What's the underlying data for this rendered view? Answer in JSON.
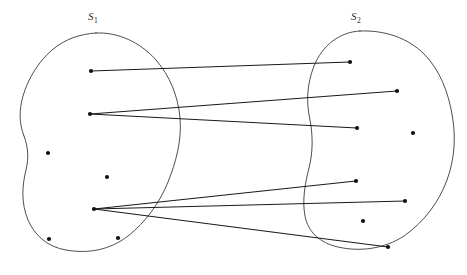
{
  "diagram": {
    "type": "set-mapping-diagram",
    "background_color": "#ffffff",
    "outline_color": "#3a3a3a",
    "edge_color": "#1a1a1a",
    "dot_color": "#111111",
    "label_color": "#2b2b2b",
    "labels": [
      {
        "id": "label-s1",
        "base": "S",
        "subscript": "1",
        "x": 88,
        "y": 20
      },
      {
        "id": "label-s2",
        "base": "S",
        "subscript": "2",
        "x": 351,
        "y": 20
      }
    ],
    "sets": [
      {
        "id": "set-s1",
        "name": "S1",
        "label": "S₁",
        "path": "M 96 33 C 118 32 140 42 156 60 C 170 76 178 96 180 118 C 182 140 176 162 168 182 C 160 202 146 222 128 236 C 110 250 88 254 66 250 C 48 247 35 236 28 220 C 21 203 22 186 26 170 C 29 157 28 147 24 136 C 19 123 19 110 23 96 C 28 79 38 62 52 50 C 65 39 80 34 96 33 Z"
      },
      {
        "id": "set-s2",
        "name": "S2",
        "label": "S₂",
        "path": "M 360 31 C 385 30 408 38 424 54 C 440 70 448 92 452 114 C 456 136 455 158 447 180 C 439 202 424 222 404 236 C 384 249 360 252 338 247 C 320 243 308 232 305 216 C 302 200 305 184 309 168 C 313 152 313 136 310 120 C 306 102 307 84 314 66 C 322 46 339 32 360 31 Z"
      }
    ],
    "points": [
      {
        "id": "p-s1-1",
        "set": "S1",
        "x": 91,
        "y": 71,
        "connected": true
      },
      {
        "id": "p-s1-2",
        "set": "S1",
        "x": 90,
        "y": 114,
        "connected": true
      },
      {
        "id": "p-s1-3",
        "set": "S1",
        "x": 48,
        "y": 153,
        "connected": false
      },
      {
        "id": "p-s1-4",
        "set": "S1",
        "x": 107,
        "y": 177,
        "connected": false
      },
      {
        "id": "p-s1-5",
        "set": "S1",
        "x": 94,
        "y": 209,
        "connected": true
      },
      {
        "id": "p-s1-6",
        "set": "S1",
        "x": 49,
        "y": 239,
        "connected": false
      },
      {
        "id": "p-s1-7",
        "set": "S1",
        "x": 118,
        "y": 238,
        "connected": false
      },
      {
        "id": "p-s2-1",
        "set": "S2",
        "x": 350,
        "y": 62,
        "connected": true
      },
      {
        "id": "p-s2-2",
        "set": "S2",
        "x": 397,
        "y": 91,
        "connected": true
      },
      {
        "id": "p-s2-3",
        "set": "S2",
        "x": 357,
        "y": 128,
        "connected": true
      },
      {
        "id": "p-s2-4",
        "set": "S2",
        "x": 413,
        "y": 133,
        "connected": false
      },
      {
        "id": "p-s2-5",
        "set": "S2",
        "x": 356,
        "y": 181,
        "connected": true
      },
      {
        "id": "p-s2-6",
        "set": "S2",
        "x": 405,
        "y": 201,
        "connected": true
      },
      {
        "id": "p-s2-7",
        "set": "S2",
        "x": 363,
        "y": 221,
        "connected": false
      },
      {
        "id": "p-s2-8",
        "set": "S2",
        "x": 388,
        "y": 247,
        "connected": true
      }
    ],
    "edges": [
      {
        "id": "e1",
        "from": "p-s1-1",
        "to": "p-s2-1",
        "x1": 91,
        "y1": 71,
        "x2": 350,
        "y2": 62
      },
      {
        "id": "e2",
        "from": "p-s1-2",
        "to": "p-s2-2",
        "x1": 90,
        "y1": 114,
        "x2": 397,
        "y2": 91
      },
      {
        "id": "e3",
        "from": "p-s1-2",
        "to": "p-s2-3",
        "x1": 90,
        "y1": 114,
        "x2": 357,
        "y2": 128
      },
      {
        "id": "e4",
        "from": "p-s1-5",
        "to": "p-s2-5",
        "x1": 94,
        "y1": 209,
        "x2": 356,
        "y2": 181
      },
      {
        "id": "e5",
        "from": "p-s1-5",
        "to": "p-s2-6",
        "x1": 94,
        "y1": 209,
        "x2": 405,
        "y2": 201
      },
      {
        "id": "e6",
        "from": "p-s1-5",
        "to": "p-s2-8",
        "x1": 94,
        "y1": 209,
        "x2": 388,
        "y2": 247
      }
    ],
    "dot_radius": 2.1
  }
}
